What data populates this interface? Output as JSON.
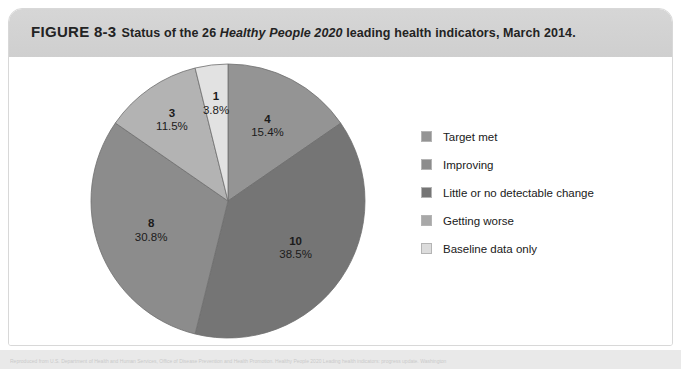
{
  "figure": {
    "label": "FIGURE 8-3",
    "caption_part1": "Status of the 26 ",
    "caption_italic": "Healthy People 2020",
    "caption_part2": " leading health indicators, March 2014.",
    "caption_full": "FIGURE 8-3 Status of the 26 Healthy People 2020 leading health indicators, March 2014."
  },
  "source": {
    "text": "Reproduced from U.S. Department of Health and Human Services, Office of Disease Prevention and Health Promotion. Healthy People 2020 Leading health indicators: progress update. Washington"
  },
  "legend": {
    "items": [
      {
        "label": "Target met",
        "color": "#949494"
      },
      {
        "label": "Improving",
        "color": "#8c8c8c"
      },
      {
        "label": "Little or no detectable change",
        "color": "#757575"
      },
      {
        "label": "Getting worse",
        "color": "#a8a8a8"
      },
      {
        "label": "Baseline data only",
        "color": "#dcdcdc"
      }
    ]
  },
  "chart_data": {
    "type": "pie",
    "title": "Status of the 26 Healthy People 2020 leading health indicators, March 2014",
    "total": 26,
    "unit": "indicators",
    "legend_position": "right",
    "categories": [
      "Target met",
      "Improving",
      "Little or no detectable change",
      "Getting worse",
      "Baseline data only"
    ],
    "values": [
      4,
      10,
      8,
      3,
      1
    ],
    "percentages": [
      15.4,
      38.5,
      30.8,
      11.5,
      3.8
    ],
    "colors": [
      "#949494",
      "#757575",
      "#8c8c8c",
      "#b3b3b3",
      "#e2e2e2"
    ],
    "slices": [
      {
        "label": "Target met",
        "count": "4",
        "count_num": 4,
        "percent": "15.4%",
        "percent_num": 15.4,
        "color": "#949494",
        "start_deg": 0,
        "end_deg": 55.4
      },
      {
        "label": "Little or no detectable change",
        "count": "10",
        "count_num": 10,
        "percent": "38.5%",
        "percent_num": 38.5,
        "color": "#757575",
        "start_deg": 55.4,
        "end_deg": 193.9
      },
      {
        "label": "Improving",
        "count": "8",
        "count_num": 8,
        "percent": "30.8%",
        "percent_num": 30.8,
        "color": "#8c8c8c",
        "start_deg": 193.9,
        "end_deg": 304.7
      },
      {
        "label": "Getting worse",
        "count": "3",
        "count_num": 3,
        "percent": "11.5%",
        "percent_num": 11.5,
        "color": "#b3b3b3",
        "start_deg": 304.7,
        "end_deg": 346.1
      },
      {
        "label": "Baseline data only",
        "count": "1",
        "count_num": 1,
        "percent": "3.8%",
        "percent_num": 3.8,
        "color": "#e2e2e2",
        "start_deg": 346.1,
        "end_deg": 360
      }
    ]
  }
}
